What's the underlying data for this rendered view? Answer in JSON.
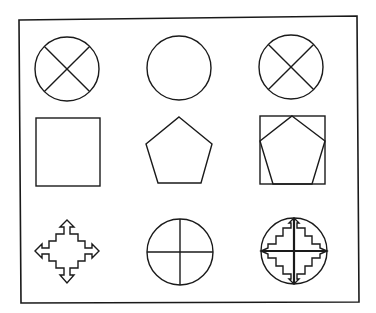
{
  "figure": {
    "description": "3x3 grid of geometric line-drawing shapes inside a rectangular frame",
    "stroke_color": "#1a1a1a",
    "background_color": "#ffffff",
    "rows": [
      {
        "cells": [
          {
            "label": "circle with X",
            "shape": "circle-x"
          },
          {
            "label": "circle",
            "shape": "circle"
          },
          {
            "label": "circle with X",
            "shape": "circle-x"
          }
        ]
      },
      {
        "cells": [
          {
            "label": "square",
            "shape": "square"
          },
          {
            "label": "pentagon",
            "shape": "pentagon"
          },
          {
            "label": "pentagon inscribed in square",
            "shape": "square-pentagon"
          }
        ]
      },
      {
        "cells": [
          {
            "label": "stepped cross with arrow tips",
            "shape": "stepped-cross"
          },
          {
            "label": "circle with plus",
            "shape": "circle-plus"
          },
          {
            "label": "stepped cross with plus inside circle",
            "shape": "circle-stepped-cross"
          }
        ]
      }
    ]
  }
}
